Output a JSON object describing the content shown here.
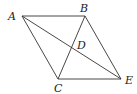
{
  "diagram": {
    "type": "geometry-figure",
    "points": {
      "A": {
        "label": "A",
        "x": 22,
        "y": 16
      },
      "B": {
        "label": "B",
        "x": 85,
        "y": 16
      },
      "C": {
        "label": "C",
        "x": 58,
        "y": 79
      },
      "E": {
        "label": "E",
        "x": 121,
        "y": 79
      },
      "D": {
        "label": "D",
        "x": 71.5,
        "y": 47.5
      }
    },
    "segments": [
      {
        "from": "A",
        "to": "B"
      },
      {
        "from": "B",
        "to": "E"
      },
      {
        "from": "E",
        "to": "C"
      },
      {
        "from": "C",
        "to": "A"
      },
      {
        "from": "A",
        "to": "E"
      },
      {
        "from": "B",
        "to": "C"
      }
    ],
    "colors": {
      "line": "#333333",
      "text": "#222222",
      "background": "#ffffff"
    }
  }
}
